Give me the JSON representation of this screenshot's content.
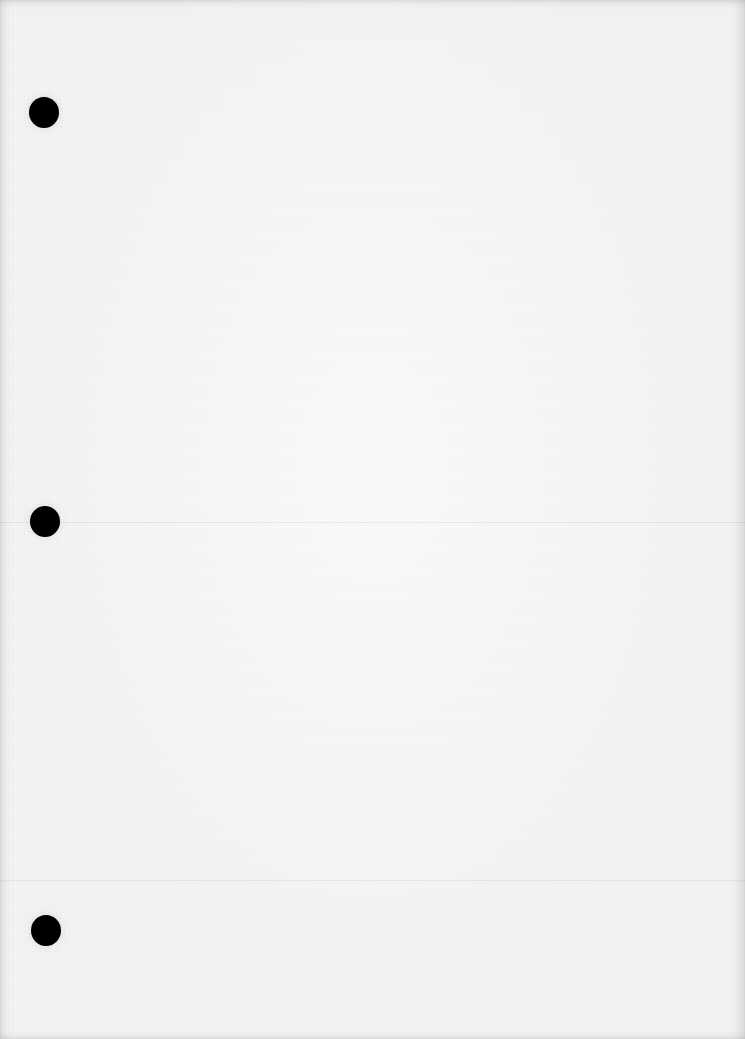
{
  "document": {
    "type": "blank-paper-sheet",
    "text_content": "",
    "paper_color": "#f3f3f3",
    "hole_color": "#000000",
    "punch_holes": [
      {
        "id": "top",
        "cx": 44,
        "cy": 112
      },
      {
        "id": "middle",
        "cx": 45,
        "cy": 521
      },
      {
        "id": "bottom",
        "cx": 46,
        "cy": 930
      }
    ],
    "fold_lines_y": [
      522,
      880
    ]
  }
}
